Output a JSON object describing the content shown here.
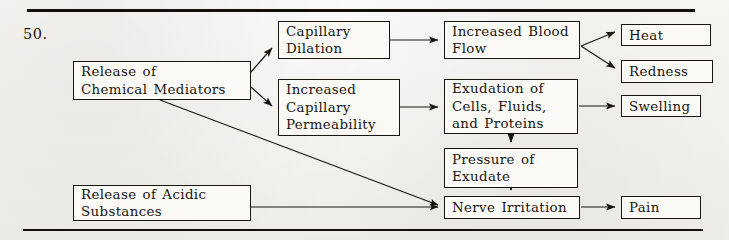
{
  "question_number": "50.",
  "page": {
    "width": 729,
    "height": 240,
    "ink_color": "#19160f",
    "paper_color": "#f4f3f0"
  },
  "diagram": {
    "type": "flowchart",
    "nodes": [
      {
        "id": "chemical_mediators",
        "label": "Release of\nChemical Mediators"
      },
      {
        "id": "acidic_substances",
        "label": "Release of Acidic\nSubstances"
      },
      {
        "id": "capillary_dilation",
        "label": "Capillary\nDilation"
      },
      {
        "id": "capillary_permeability",
        "label": "Increased\nCapillary\nPermeability"
      },
      {
        "id": "increased_blood_flow",
        "label": "Increased Blood\nFlow"
      },
      {
        "id": "exudation",
        "label": "Exudation of\nCells,  Fluids,\nand Proteins"
      },
      {
        "id": "pressure_exudate",
        "label": "Pressure of\nExudate"
      },
      {
        "id": "nerve_irritation",
        "label": "Nerve  Irritation"
      },
      {
        "id": "heat",
        "label": "Heat"
      },
      {
        "id": "redness",
        "label": "Redness"
      },
      {
        "id": "swelling",
        "label": "Swelling"
      },
      {
        "id": "pain",
        "label": "Pain"
      }
    ],
    "edges": [
      {
        "from": "chemical_mediators",
        "to": "capillary_dilation"
      },
      {
        "from": "chemical_mediators",
        "to": "capillary_permeability"
      },
      {
        "from": "chemical_mediators",
        "to": "nerve_irritation"
      },
      {
        "from": "capillary_dilation",
        "to": "increased_blood_flow"
      },
      {
        "from": "capillary_permeability",
        "to": "exudation"
      },
      {
        "from": "increased_blood_flow",
        "to": "heat"
      },
      {
        "from": "increased_blood_flow",
        "to": "redness"
      },
      {
        "from": "exudation",
        "to": "swelling"
      },
      {
        "from": "exudation",
        "to": "pressure_exudate"
      },
      {
        "from": "pressure_exudate",
        "to": "nerve_irritation"
      },
      {
        "from": "acidic_substances",
        "to": "nerve_irritation"
      },
      {
        "from": "nerve_irritation",
        "to": "pain"
      }
    ]
  }
}
